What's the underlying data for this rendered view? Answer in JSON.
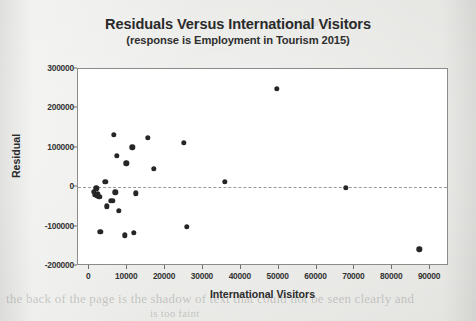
{
  "figure": {
    "title": "Residuals Versus International Visitors",
    "subtitle": "(response is Employment in Tourism 2015)"
  },
  "background_text": {
    "line1": "the back of the page is the shadow of text that could not be seen clearly and",
    "line2": "is too faint",
    "line3": "Chart 1"
  },
  "colors": {
    "marker": "#262626",
    "frame": "#8b8b8b",
    "zero_line": "#9a9a9a",
    "plot_background": "#ffffff",
    "page_background": "#e6e6e3",
    "text": "#2b2b2b"
  },
  "chart_data": {
    "type": "scatter",
    "title": "Residuals Versus International Visitors",
    "subtitle": "(response is Employment in Tourism 2015)",
    "xlabel": "International Visitors",
    "ylabel": "Residual",
    "xlim": [
      -3000,
      95000
    ],
    "ylim": [
      -200000,
      300000
    ],
    "xticks": [
      0,
      10000,
      20000,
      30000,
      40000,
      50000,
      60000,
      70000,
      80000,
      90000
    ],
    "xticklabels": [
      "0",
      "10000",
      "20000",
      "30000",
      "40000",
      "50000",
      "60000",
      "70000",
      "80000",
      "90000"
    ],
    "yticks": [
      -200000,
      -100000,
      0,
      100000,
      200000,
      300000
    ],
    "yticklabels": [
      "-200000",
      "-100000",
      "0",
      "100000",
      "200000",
      "300000"
    ],
    "grid": false,
    "legend": false,
    "reference_line": {
      "y": 0,
      "style": "dashed",
      "color": "#9a9a9a"
    },
    "marker": {
      "shape": "circle",
      "color": "#262626",
      "size": 5
    },
    "points": [
      {
        "x": 1200,
        "y": -12000
      },
      {
        "x": 1500,
        "y": -20000
      },
      {
        "x": 1800,
        "y": -3000
      },
      {
        "x": 2100,
        "y": -22000
      },
      {
        "x": 2300,
        "y": -16000
      },
      {
        "x": 2600,
        "y": -24000
      },
      {
        "x": 2900,
        "y": -113000
      },
      {
        "x": 4200,
        "y": 13000
      },
      {
        "x": 4600,
        "y": -48000
      },
      {
        "x": 5600,
        "y": -35000
      },
      {
        "x": 6200,
        "y": -34000
      },
      {
        "x": 6400,
        "y": 133000
      },
      {
        "x": 6900,
        "y": -13000
      },
      {
        "x": 7200,
        "y": 79000
      },
      {
        "x": 7800,
        "y": -60000
      },
      {
        "x": 9300,
        "y": -122000
      },
      {
        "x": 9800,
        "y": 61000
      },
      {
        "x": 11300,
        "y": 101000
      },
      {
        "x": 11800,
        "y": -116000
      },
      {
        "x": 12200,
        "y": -15000
      },
      {
        "x": 15400,
        "y": 126000
      },
      {
        "x": 17000,
        "y": 47000
      },
      {
        "x": 25000,
        "y": 112000
      },
      {
        "x": 25800,
        "y": -101000
      },
      {
        "x": 35800,
        "y": 14000
      },
      {
        "x": 49500,
        "y": 249000
      },
      {
        "x": 67700,
        "y": -2000
      },
      {
        "x": 87200,
        "y": -158000
      }
    ]
  }
}
